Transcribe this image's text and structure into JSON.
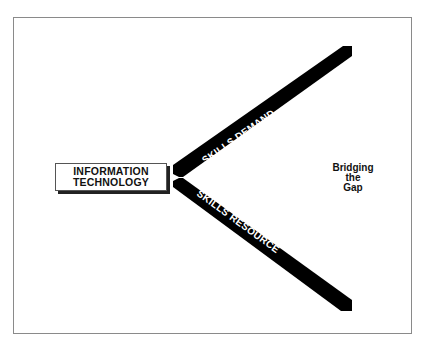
{
  "header": {
    "title_fragment": ""
  },
  "diagram": {
    "source_box": {
      "line1": "INFORMATION",
      "line2": "TECHNOLOGY"
    },
    "upper_arm": {
      "label": "SKILLS DEMAND"
    },
    "lower_arm": {
      "label": "SKILLS RESOURCE"
    },
    "gap_label": {
      "line1": "Bridging",
      "line2": "the",
      "line3": "Gap"
    },
    "colors": {
      "bar": "#000000",
      "frame": "#8a8a8a",
      "text": "#111111",
      "background": "#ffffff"
    }
  }
}
